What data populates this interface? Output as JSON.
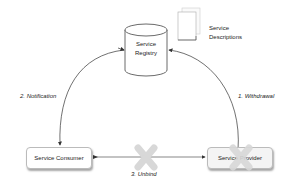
{
  "diagram": {
    "registry": {
      "line1": "Service",
      "line2": "Registry"
    },
    "descriptions": {
      "line1": "Service",
      "line2": "Descriptions"
    },
    "consumer": {
      "label": "Service Consumer"
    },
    "provider": {
      "label": "Service Provider"
    },
    "edges": {
      "withdrawal": "1. Withdrawal",
      "notification": "2. Notification",
      "unbind": "3. Unbind"
    },
    "colors": {
      "cross": "#d8d8d8",
      "line": "#333333",
      "box_border": "#bbbbbb"
    }
  }
}
